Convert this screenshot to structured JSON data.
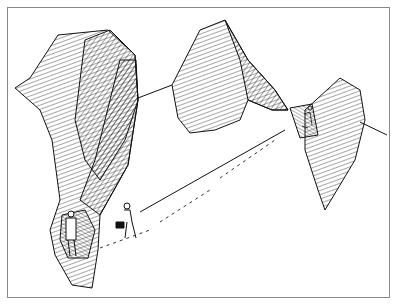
{
  "illustration": {
    "subject": "line-art drawing of hatched mountain peaks with a figure near a cave at bottom-left and a figure with a dog on a long straight rope/path leading to a figure in a niche on the right peak",
    "colors": {
      "ink": "#1a1a1a",
      "paper": "#ffffff",
      "border": "#888888"
    }
  }
}
